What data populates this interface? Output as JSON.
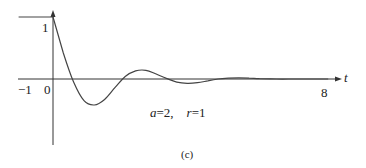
{
  "chart_data": {
    "type": "line",
    "title": "",
    "xlabel": "t",
    "ylabel": "",
    "xlim": [
      -1,
      8
    ],
    "ylim": [
      -1,
      1
    ],
    "grid": false,
    "legend": null,
    "x_ticks": [
      "-1",
      "0",
      "8"
    ],
    "y_ticks": [
      "1"
    ],
    "annotation": "a=2,   r=1",
    "caption": "(c)",
    "series": [
      {
        "name": "response",
        "x": [
          -1,
          0,
          0.3,
          0.6,
          0.9,
          1.2,
          1.5,
          1.8,
          2.1,
          2.4,
          2.7,
          3.0,
          3.3,
          3.6,
          3.9,
          4.2,
          4.5,
          4.8,
          5.1,
          5.4,
          5.7,
          6.0,
          6.5,
          7.0,
          7.5,
          8.0
        ],
        "values": [
          1,
          1,
          0.42,
          -0.05,
          -0.35,
          -0.42,
          -0.33,
          -0.14,
          0.04,
          0.13,
          0.14,
          0.08,
          0.01,
          -0.05,
          -0.07,
          -0.06,
          -0.03,
          0.0,
          0.015,
          0.02,
          0.015,
          0.005,
          0.0,
          0.0,
          0.0,
          0.0
        ]
      }
    ]
  },
  "labels": {
    "y_one": "1",
    "x_minus_one": "−1",
    "x_zero": "0",
    "x_eight": "8",
    "x_axis_name": "t",
    "params_a": "a",
    "params_a_eq": "=2,",
    "params_r": "r",
    "params_r_eq": "=1",
    "caption": "(c)"
  },
  "colors": {
    "axis": "#333333",
    "curve": "#444444",
    "text": "#222222"
  }
}
